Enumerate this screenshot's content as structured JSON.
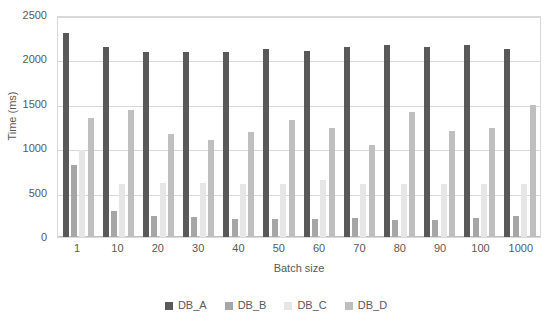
{
  "chart_data": {
    "type": "bar",
    "title": "",
    "xlabel": "Batch size",
    "ylabel": "Time (ms)",
    "ylim": [
      0,
      2500
    ],
    "ytick_step": 500,
    "yticks": [
      "2500",
      "2000",
      "1500",
      "1000",
      "500",
      "0"
    ],
    "grid": true,
    "legend_position": "bottom",
    "categories": [
      "1",
      "10",
      "20",
      "30",
      "40",
      "50",
      "60",
      "70",
      "80",
      "90",
      "100",
      "1000"
    ],
    "series": [
      {
        "name": "DB_A",
        "color": "#595959",
        "values": [
          2300,
          2140,
          2085,
          2080,
          2080,
          2115,
          2090,
          2145,
          2160,
          2145,
          2165,
          2120
        ]
      },
      {
        "name": "DB_B",
        "color": "#a6a6a6",
        "values": [
          810,
          290,
          240,
          230,
          205,
          205,
          200,
          210,
          195,
          195,
          215,
          235
        ]
      },
      {
        "name": "DB_C",
        "color": "#e6e6e6",
        "values": [
          980,
          600,
          610,
          605,
          600,
          600,
          645,
          600,
          600,
          600,
          600,
          595
        ]
      },
      {
        "name": "DB_D",
        "color": "#bfbfbf",
        "values": [
          1340,
          1430,
          1165,
          1095,
          1185,
          1315,
          1230,
          1035,
          1410,
          1195,
          1230,
          1490
        ]
      }
    ]
  },
  "legend": {
    "items": [
      {
        "label": "DB_A",
        "color": "#595959"
      },
      {
        "label": "DB_B",
        "color": "#a6a6a6"
      },
      {
        "label": "DB_C",
        "color": "#e6e6e6"
      },
      {
        "label": "DB_D",
        "color": "#bfbfbf"
      }
    ]
  }
}
